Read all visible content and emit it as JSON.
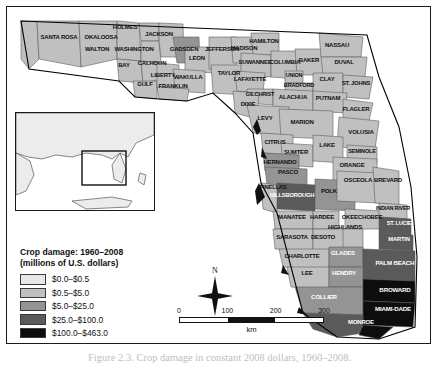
{
  "map": {
    "title": "Florida crop damage choropleth map",
    "state": "Florida"
  },
  "legend": {
    "title_line1": "Crop damage: 1960–2008",
    "title_line2": "(millions of U.S. dollars)",
    "classes": [
      {
        "label": "$0.0–$0.5",
        "color": "#e8e8e8"
      },
      {
        "label": "$0.5–$5.0",
        "color": "#c0c0c0"
      },
      {
        "label": "$5.0–$25.0",
        "color": "#949494"
      },
      {
        "label": "$25.0–$100.0",
        "color": "#5a5a5a"
      },
      {
        "label": "$100.0–$463.0",
        "color": "#0d0d0d"
      }
    ]
  },
  "scalebar": {
    "ticks": [
      "0",
      "100",
      "200",
      "300"
    ],
    "unit": "km"
  },
  "north_arrow": {
    "label": "N"
  },
  "caption": {
    "text": "Figure 2.3. Crop damage in constant 2008 dollars, 1960–2008."
  },
  "inset": {
    "label": ""
  },
  "counties": [
    {
      "name": "SANTA ROSA",
      "x": 52,
      "y": 32,
      "cls": 1,
      "fs": 6.0,
      "light": false
    },
    {
      "name": "OKALOOSA",
      "x": 94,
      "y": 32,
      "cls": 1,
      "fs": 6.0,
      "light": false
    },
    {
      "name": "WALTON",
      "x": 90,
      "y": 44,
      "cls": 1,
      "fs": 6.0,
      "light": false
    },
    {
      "name": "HOLMES",
      "x": 118,
      "y": 22,
      "cls": 1,
      "fs": 6.0,
      "light": false
    },
    {
      "name": "WASHINGTON",
      "x": 127,
      "y": 44,
      "cls": 1,
      "fs": 6.0,
      "light": false
    },
    {
      "name": "JACKSON",
      "x": 152,
      "y": 29,
      "cls": 1,
      "fs": 6.0,
      "light": false
    },
    {
      "name": "BAY",
      "x": 117,
      "y": 60,
      "cls": 1,
      "fs": 6.0,
      "light": false
    },
    {
      "name": "CALHOUN",
      "x": 145,
      "y": 58,
      "cls": 1,
      "fs": 6.0,
      "light": false
    },
    {
      "name": "GULF",
      "x": 138,
      "y": 79,
      "cls": 1,
      "fs": 6.0,
      "light": false
    },
    {
      "name": "LIBERTY",
      "x": 156,
      "y": 70,
      "cls": 1,
      "fs": 6.0,
      "light": false
    },
    {
      "name": "GADSDEN",
      "x": 177,
      "y": 44,
      "cls": 3,
      "fs": 6.0,
      "light": false
    },
    {
      "name": "LEON",
      "x": 190,
      "y": 53,
      "cls": 1,
      "fs": 6.0,
      "light": false
    },
    {
      "name": "WAKULLA",
      "x": 181,
      "y": 72,
      "cls": 1,
      "fs": 6.0,
      "light": false
    },
    {
      "name": "FRANKLIN",
      "x": 166,
      "y": 81,
      "cls": 1,
      "fs": 6.0,
      "light": false
    },
    {
      "name": "JEFFERSON",
      "x": 215,
      "y": 44,
      "cls": 1,
      "fs": 6.0,
      "light": false
    },
    {
      "name": "MADISON",
      "x": 237,
      "y": 43,
      "cls": 1,
      "fs": 6.0,
      "light": false
    },
    {
      "name": "TAYLOR",
      "x": 222,
      "y": 68,
      "cls": 1,
      "fs": 6.0,
      "light": false
    },
    {
      "name": "HAMILTON",
      "x": 257,
      "y": 36,
      "cls": 1,
      "fs": 6.0,
      "light": false
    },
    {
      "name": "SUWANNEE",
      "x": 248,
      "y": 57,
      "cls": 1,
      "fs": 6.0,
      "light": false
    },
    {
      "name": "LAFAYETTE",
      "x": 243,
      "y": 74,
      "cls": 1,
      "fs": 6.0,
      "light": false
    },
    {
      "name": "COLUMBIA",
      "x": 278,
      "y": 57,
      "cls": 1,
      "fs": 6.0,
      "light": false
    },
    {
      "name": "BAKER",
      "x": 302,
      "y": 55,
      "cls": 1,
      "fs": 6.0,
      "light": false
    },
    {
      "name": "NASSAU",
      "x": 330,
      "y": 40,
      "cls": 1,
      "fs": 6.0,
      "light": false
    },
    {
      "name": "DUVAL",
      "x": 337,
      "y": 57,
      "cls": 1,
      "fs": 6.0,
      "light": false
    },
    {
      "name": "UNION",
      "x": 287,
      "y": 70,
      "cls": 1,
      "fs": 5.4,
      "light": false
    },
    {
      "name": "BRADFORD",
      "x": 292,
      "y": 80,
      "cls": 1,
      "fs": 5.6,
      "light": false
    },
    {
      "name": "CLAY",
      "x": 320,
      "y": 74,
      "cls": 1,
      "fs": 6.0,
      "light": false
    },
    {
      "name": "ST. JOHNS",
      "x": 349,
      "y": 78,
      "cls": 1,
      "fs": 5.8,
      "light": false
    },
    {
      "name": "GILCHRIST",
      "x": 253,
      "y": 89,
      "cls": 1,
      "fs": 5.6,
      "light": false
    },
    {
      "name": "DIXIE",
      "x": 241,
      "y": 99,
      "cls": 1,
      "fs": 6.0,
      "light": false
    },
    {
      "name": "ALACHUA",
      "x": 286,
      "y": 92,
      "cls": 1,
      "fs": 6.0,
      "light": false
    },
    {
      "name": "PUTNAM",
      "x": 321,
      "y": 93,
      "cls": 1,
      "fs": 6.0,
      "light": false
    },
    {
      "name": "LEVY",
      "x": 258,
      "y": 113,
      "cls": 1,
      "fs": 6.0,
      "light": false
    },
    {
      "name": "MARION",
      "x": 295,
      "y": 117,
      "cls": 1,
      "fs": 6.0,
      "light": false
    },
    {
      "name": "FLAGLER",
      "x": 349,
      "y": 104,
      "cls": 1,
      "fs": 6.0,
      "light": false
    },
    {
      "name": "VOLUSIA",
      "x": 354,
      "y": 127,
      "cls": 1,
      "fs": 6.0,
      "light": false
    },
    {
      "name": "CITRUS",
      "x": 268,
      "y": 137,
      "cls": 1,
      "fs": 6.0,
      "light": false
    },
    {
      "name": "SUMTER",
      "x": 289,
      "y": 147,
      "cls": 1,
      "fs": 6.0,
      "light": false
    },
    {
      "name": "LAKE",
      "x": 320,
      "y": 140,
      "cls": 1,
      "fs": 6.0,
      "light": false
    },
    {
      "name": "SEMINOLE",
      "x": 355,
      "y": 146,
      "cls": 1,
      "fs": 5.6,
      "light": false
    },
    {
      "name": "HERNANDO",
      "x": 273,
      "y": 157,
      "cls": 3,
      "fs": 6.0,
      "light": false
    },
    {
      "name": "ORANGE",
      "x": 345,
      "y": 160,
      "cls": 1,
      "fs": 6.0,
      "light": false
    },
    {
      "name": "PASCO",
      "x": 281,
      "y": 167,
      "cls": 3,
      "fs": 6.0,
      "light": false
    },
    {
      "name": "PINELLAS",
      "x": 266,
      "y": 182,
      "cls": 1,
      "fs": 5.8,
      "light": false
    },
    {
      "name": "HILLSBOROUGH",
      "x": 285,
      "y": 190,
      "cls": 4,
      "fs": 5.8,
      "light": true
    },
    {
      "name": "POLK",
      "x": 322,
      "y": 186,
      "cls": 3,
      "fs": 6.0,
      "light": false
    },
    {
      "name": "OSCEOLA",
      "x": 351,
      "y": 175,
      "cls": 1,
      "fs": 6.0,
      "light": false
    },
    {
      "name": "BREVARD",
      "x": 381,
      "y": 175,
      "cls": 1,
      "fs": 6.0,
      "light": false
    },
    {
      "name": "MANATEE",
      "x": 285,
      "y": 212,
      "cls": 1,
      "fs": 6.0,
      "light": false
    },
    {
      "name": "HARDEE",
      "x": 315,
      "y": 212,
      "cls": 1,
      "fs": 6.0,
      "light": false
    },
    {
      "name": "OKEECHOBEE",
      "x": 355,
      "y": 212,
      "cls": 1,
      "fs": 6.0,
      "light": false
    },
    {
      "name": "HIGHLANDS",
      "x": 338,
      "y": 222,
      "cls": 1,
      "fs": 6.0,
      "light": false
    },
    {
      "name": "INDIAN RIVER",
      "x": 386,
      "y": 203,
      "cls": 1,
      "fs": 5.4,
      "light": false
    },
    {
      "name": "ST. LUCIE",
      "x": 392,
      "y": 218,
      "cls": 4,
      "fs": 5.6,
      "light": true
    },
    {
      "name": "SARASOTA",
      "x": 285,
      "y": 232,
      "cls": 1,
      "fs": 6.0,
      "light": false
    },
    {
      "name": "DESOTO",
      "x": 316,
      "y": 232,
      "cls": 1,
      "fs": 6.0,
      "light": false
    },
    {
      "name": "MARTIN",
      "x": 392,
      "y": 234,
      "cls": 4,
      "fs": 5.8,
      "light": true
    },
    {
      "name": "CHARLOTTE",
      "x": 295,
      "y": 251,
      "cls": 1,
      "fs": 6.0,
      "light": false
    },
    {
      "name": "GLADES",
      "x": 336,
      "y": 248,
      "cls": 3,
      "fs": 6.0,
      "light": true
    },
    {
      "name": "PALM BEACH",
      "x": 388,
      "y": 258,
      "cls": 4,
      "fs": 6.2,
      "light": true
    },
    {
      "name": "LEE",
      "x": 300,
      "y": 268,
      "cls": 1,
      "fs": 6.0,
      "light": false
    },
    {
      "name": "HENDRY",
      "x": 337,
      "y": 268,
      "cls": 3,
      "fs": 6.0,
      "light": true
    },
    {
      "name": "COLLIER",
      "x": 317,
      "y": 292,
      "cls": 3,
      "fs": 6.2,
      "light": true
    },
    {
      "name": "BROWARD",
      "x": 388,
      "y": 285,
      "cls": 5,
      "fs": 6.2,
      "light": true
    },
    {
      "name": "MIAMI-DADE",
      "x": 386,
      "y": 304,
      "cls": 5,
      "fs": 6.2,
      "light": true
    },
    {
      "name": "MONROE",
      "x": 354,
      "y": 317,
      "cls": 4,
      "fs": 6.0,
      "light": true
    }
  ]
}
